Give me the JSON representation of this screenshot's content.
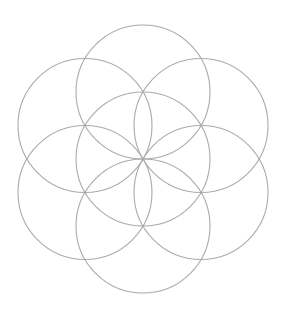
{
  "diagram": {
    "name": "Seed of Life",
    "circle_count": 7,
    "arrangement": "one central circle with six circles centered on its circumference at 60-degree intervals",
    "stroke_color": "#aaaaaa",
    "background_color": "#ffffff",
    "circles": [
      {
        "id": "center",
        "angle_deg": null
      },
      {
        "id": "top",
        "angle_deg": 90
      },
      {
        "id": "upper-right",
        "angle_deg": 30
      },
      {
        "id": "lower-right",
        "angle_deg": -30
      },
      {
        "id": "bottom",
        "angle_deg": -90
      },
      {
        "id": "lower-left",
        "angle_deg": -150
      },
      {
        "id": "upper-left",
        "angle_deg": 150
      }
    ]
  }
}
